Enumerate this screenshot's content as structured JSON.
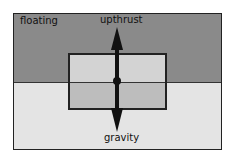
{
  "diagram": {
    "title_label": "floating",
    "forces": {
      "up": "upthrust",
      "down": "gravity"
    },
    "colors": {
      "air": "#8a8a8a",
      "water": "#e4e4e4",
      "block_above": "#d3d3d3",
      "block_below": "#bdbdbd",
      "arrow": "#111111"
    }
  }
}
